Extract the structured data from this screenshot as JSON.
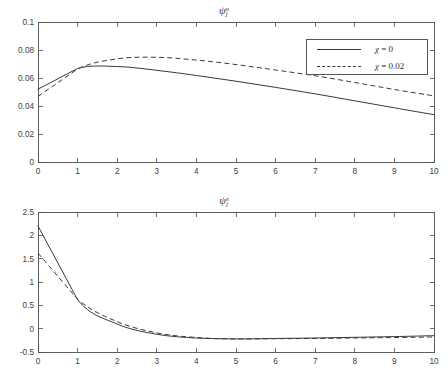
{
  "figure": {
    "background": "#ffffff",
    "line_color": "#3a3a3a",
    "axis_color": "#4d4d4d"
  },
  "chart_data": [
    {
      "type": "line",
      "panel": "top",
      "title": "ψⱼⁿ",
      "title_parts": {
        "symbol": "ψ",
        "subscript": "j",
        "superscript": "n"
      },
      "xlabel": "",
      "ylabel": "",
      "xlim": [
        0,
        10
      ],
      "ylim": [
        0,
        0.1
      ],
      "xticks": [
        0,
        1,
        2,
        3,
        4,
        5,
        6,
        7,
        8,
        9,
        10
      ],
      "xticklabels": [
        "0",
        "1",
        "2",
        "3",
        "4",
        "5",
        "6",
        "7",
        "8",
        "9",
        "10"
      ],
      "yticks": [
        0,
        0.02,
        0.04,
        0.06,
        0.08,
        0.1
      ],
      "yticklabels": [
        "0",
        "0.02",
        "0.04",
        "0.06",
        "0.08",
        "0.1"
      ],
      "grid": false,
      "legend_position": "upper right",
      "x": [
        0,
        1,
        2,
        3,
        4,
        5,
        6,
        7,
        8,
        9,
        10
      ],
      "series": [
        {
          "name": "χ = 0",
          "style": "solid",
          "values": [
            0.052,
            0.0668,
            0.0682,
            0.0655,
            0.0618,
            0.0577,
            0.0533,
            0.0487,
            0.0437,
            0.0387,
            0.0338
          ]
        },
        {
          "name": "χ = 0.02",
          "style": "dashed",
          "values": [
            0.0468,
            0.0665,
            0.0737,
            0.0748,
            0.0728,
            0.0696,
            0.0657,
            0.0616,
            0.0568,
            0.0518,
            0.0472
          ]
        }
      ]
    },
    {
      "type": "line",
      "panel": "bottom",
      "title": "ψⱼˣ",
      "title_parts": {
        "symbol": "ψ",
        "subscript": "j",
        "superscript": "x"
      },
      "xlabel": "",
      "ylabel": "",
      "xlim": [
        0,
        10
      ],
      "ylim": [
        -0.5,
        2.5
      ],
      "xticks": [
        0,
        1,
        2,
        3,
        4,
        5,
        6,
        7,
        8,
        9,
        10
      ],
      "xticklabels": [
        "0",
        "1",
        "2",
        "3",
        "4",
        "5",
        "6",
        "7",
        "8",
        "9",
        "10"
      ],
      "yticks": [
        -0.5,
        0,
        0.5,
        1,
        1.5,
        2,
        2.5
      ],
      "yticklabels": [
        "-0.5",
        "0",
        "0.5",
        "1",
        "1.5",
        "2",
        "2.5"
      ],
      "grid": false,
      "legend_position": "upper right",
      "x": [
        0,
        1,
        2,
        3,
        4,
        5,
        6,
        7,
        8,
        9,
        10
      ],
      "series": [
        {
          "name": "χ = 0",
          "style": "solid",
          "values": [
            2.2,
            0.62,
            0.1,
            -0.12,
            -0.2,
            -0.22,
            -0.21,
            -0.2,
            -0.185,
            -0.17,
            -0.15
          ]
        },
        {
          "name": "χ = 0.02",
          "style": "dashed",
          "values": [
            1.62,
            0.63,
            0.15,
            -0.09,
            -0.19,
            -0.22,
            -0.215,
            -0.21,
            -0.2,
            -0.19,
            -0.178
          ]
        }
      ]
    }
  ],
  "legend": {
    "entries": [
      {
        "label_symbol": "χ",
        "label_rest": " = 0",
        "style": "solid"
      },
      {
        "label_symbol": "χ",
        "label_rest": " = 0.02",
        "style": "dashed"
      }
    ]
  }
}
